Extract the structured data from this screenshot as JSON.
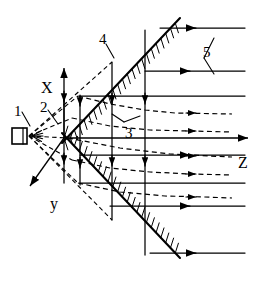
{
  "figure": {
    "kind": "schematic-diagram",
    "background": "#ffffff",
    "ink": "#000000",
    "width": 268,
    "height": 284
  },
  "axes": {
    "x": {
      "label": "X",
      "x": 41,
      "y": 80,
      "direction": "up",
      "line": {
        "x1": 64,
        "y1": 138,
        "x2": 64,
        "y2": 68
      }
    },
    "y": {
      "label": "y",
      "x": 50,
      "y": 196,
      "direction": "down-left",
      "line": {
        "x1": 64,
        "y1": 138,
        "x2": 30,
        "y2": 186
      }
    },
    "z": {
      "label": "Z",
      "x": 238,
      "y": 155,
      "direction": "right",
      "line": {
        "x1": 64,
        "y1": 138,
        "x2": 248,
        "y2": 138
      }
    },
    "origin": {
      "x": 64,
      "y": 138
    }
  },
  "callouts": [
    {
      "id": "1",
      "text": "1",
      "x": 14,
      "y": 104,
      "target": "source"
    },
    {
      "id": "2",
      "text": "2",
      "x": 40,
      "y": 100,
      "target": "ray-upper"
    },
    {
      "id": "3",
      "text": "3",
      "x": 125,
      "y": 126,
      "target": "streamline-dashed"
    },
    {
      "id": "4",
      "text": "4",
      "x": 99,
      "y": 32,
      "target": "wall-upper"
    },
    {
      "id": "5",
      "text": "5",
      "x": 203,
      "y": 45,
      "target": "flow-lines"
    }
  ],
  "source": {
    "name": "emitter",
    "x": 12,
    "y": 136,
    "box": {
      "w": 15,
      "h": 16
    }
  },
  "walls": [
    {
      "name": "wall-upper",
      "x1": 62,
      "y1": 143,
      "x2": 180,
      "y2": 18,
      "hatch_side": "up-left"
    },
    {
      "name": "wall-lower",
      "x1": 62,
      "y1": 133,
      "x2": 180,
      "y2": 258,
      "hatch_side": "down-left"
    }
  ],
  "flow_lines_solid": [
    {
      "y": 28,
      "x1": 160,
      "x2": 245,
      "arrow_x": 196
    },
    {
      "y": 71,
      "x1": 145,
      "x2": 245,
      "arrow_x": 190
    },
    {
      "y": 96,
      "x1": 80,
      "x2": 245,
      "arrow_x": 0
    },
    {
      "y": 155,
      "x1": 80,
      "x2": 245,
      "arrow_x": 190
    },
    {
      "y": 183,
      "x1": 80,
      "x2": 245,
      "arrow_x": 0
    },
    {
      "y": 206,
      "x1": 110,
      "x2": 245,
      "arrow_x": 190
    },
    {
      "y": 253,
      "x1": 150,
      "x2": 245,
      "arrow_x": 196
    }
  ],
  "streamlines_dashed": [
    {
      "points": "78,96 110,104 145,110 175,113 232,114",
      "arrow_x": 196,
      "arrow_y": 113
    },
    {
      "points": "72,118 110,126 150,130 190,131 232,132",
      "arrow_x": 196,
      "arrow_y": 131
    },
    {
      "points": "68,138 120,148 170,154 210,156 232,157",
      "arrow_x": 196,
      "arrow_y": 156
    },
    {
      "points": "72,160 110,168 150,172 190,174 232,175",
      "arrow_x": 196,
      "arrow_y": 174
    },
    {
      "points": "78,183 120,192 165,196 205,197 232,198",
      "arrow_x": 196,
      "arrow_y": 197
    }
  ],
  "verticals": [
    {
      "x": 64,
      "y1": 95,
      "y2": 183,
      "arrows": [
        102,
        164
      ]
    },
    {
      "x": 80,
      "y1": 96,
      "y2": 185,
      "arrows": [
        106,
        168
      ]
    },
    {
      "x": 112,
      "y1": 62,
      "y2": 220,
      "arrows": [
        104,
        166
      ]
    },
    {
      "x": 145,
      "y1": 30,
      "y2": 255,
      "arrows": [
        104,
        166
      ]
    }
  ]
}
